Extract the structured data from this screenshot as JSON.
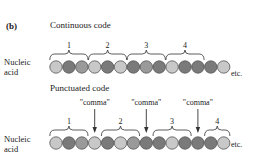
{
  "panel_label": "(b)",
  "continuous": {
    "title": "Continuous code",
    "row_label_1": "Nucleic",
    "row_label_2": "acid",
    "etc": "etc.",
    "codon_labels": [
      "1",
      "2",
      "3",
      "4"
    ],
    "bases": [
      "light",
      "dark",
      "medium",
      "light",
      "dark",
      "light",
      "dark",
      "medium",
      "dark",
      "light",
      "dark",
      "dark",
      "dark",
      "light"
    ]
  },
  "punctuated": {
    "title": "Punctuated code",
    "row_label_1": "Nucleic",
    "row_label_2": "acid",
    "etc": "etc.",
    "codon_labels": [
      "1",
      "2",
      "3",
      "4"
    ],
    "comma_label": "\"comma\"",
    "bases": [
      "light",
      "dark",
      "medium",
      "light",
      "dark",
      "light",
      "medium",
      "dark",
      "dark",
      "light",
      "dark",
      "dark",
      "dark",
      "light"
    ]
  },
  "colors": {
    "light": "#c8c8c8",
    "medium": "#9a9a9a",
    "dark": "#7a7a7a",
    "outline": "#555555"
  }
}
